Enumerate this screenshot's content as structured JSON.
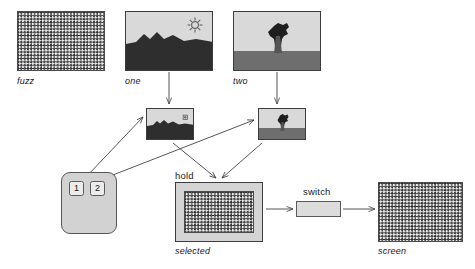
{
  "diagram": {
    "background": "#ffffff",
    "line_color": "#444444",
    "labels": {
      "fuzz": "fuzz",
      "one": "one",
      "two": "two",
      "hold": "hold",
      "selected": "selected",
      "switch": "switch",
      "screen": "screen"
    },
    "remote": {
      "button_one": "1",
      "button_two": "2"
    },
    "nodes": [
      {
        "id": "fuzz",
        "label": "fuzz",
        "kind": "noise-texture",
        "x": 17,
        "y": 11,
        "w": 88,
        "h": 60
      },
      {
        "id": "one",
        "label": "one",
        "kind": "picture",
        "x": 125,
        "y": 11,
        "w": 88,
        "h": 60
      },
      {
        "id": "two",
        "label": "two",
        "kind": "picture",
        "x": 233,
        "y": 11,
        "w": 88,
        "h": 60
      },
      {
        "id": "thumb-one",
        "label": "",
        "kind": "picture",
        "x": 146,
        "y": 108,
        "w": 48,
        "h": 32
      },
      {
        "id": "thumb-two",
        "label": "",
        "kind": "picture",
        "x": 258,
        "y": 108,
        "w": 48,
        "h": 32
      },
      {
        "id": "remote",
        "label": "",
        "kind": "remote",
        "x": 61,
        "y": 172,
        "w": 56,
        "h": 62
      },
      {
        "id": "selected",
        "label": "selected",
        "kind": "noise-texture",
        "x": 175,
        "y": 182,
        "w": 88,
        "h": 60
      },
      {
        "id": "switch",
        "label": "switch",
        "kind": "switch",
        "x": 296,
        "y": 201,
        "w": 45,
        "h": 16
      },
      {
        "id": "screen",
        "label": "screen",
        "kind": "noise-texture",
        "x": 378,
        "y": 182,
        "w": 85,
        "h": 60
      }
    ],
    "edges": [
      {
        "from": "one",
        "to": "thumb-one",
        "style": "arrow"
      },
      {
        "from": "two",
        "to": "thumb-two",
        "style": "arrow"
      },
      {
        "from": "remote",
        "to": "thumb-one",
        "style": "arrow"
      },
      {
        "from": "remote",
        "to": "thumb-two",
        "style": "arrow"
      },
      {
        "from": "thumb-one",
        "to": "selected",
        "style": "arrow"
      },
      {
        "from": "thumb-two",
        "to": "selected",
        "style": "arrow"
      },
      {
        "from": "selected",
        "to": "switch",
        "style": "arrow"
      },
      {
        "from": "switch",
        "to": "screen",
        "style": "arrow"
      }
    ],
    "colors": {
      "noise_dark": "#2b2b2b",
      "noise_light": "#e9e9e9",
      "picture_sky": "#d9d9d9",
      "picture_ground": "#6e6e6e",
      "picture_ground_dark": "#2e2e2e",
      "remote_body": "#d2d2d2",
      "button_face": "#ececec",
      "hold_body": "#d4d4d4",
      "switch_body": "#dcdcdc",
      "stroke": "#3d3d3d"
    }
  }
}
